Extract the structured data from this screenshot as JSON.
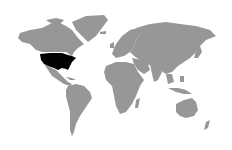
{
  "map": {
    "type": "world-choropleth",
    "projection": "miller",
    "background": "#ffffff",
    "land_color": "#979797",
    "highlight_color": "#000000",
    "highlighted_regions": [
      "United States"
    ]
  }
}
